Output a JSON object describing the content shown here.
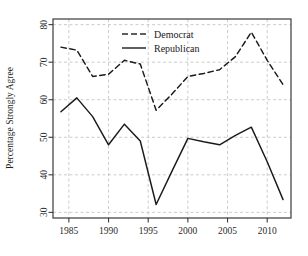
{
  "chart_data": {
    "type": "line",
    "title": "",
    "subtitle": "",
    "xlabel": "",
    "ylabel": "Percentage Strongly Agree",
    "x": [
      1984,
      1986,
      1988,
      1990,
      1992,
      1994,
      1996,
      1998,
      2000,
      2002,
      2004,
      2006,
      2008,
      2010,
      2012
    ],
    "xlim": [
      1983,
      2013
    ],
    "ylim": [
      28.5,
      81.5
    ],
    "xticks": [
      1985,
      1990,
      1995,
      2000,
      2005,
      2010
    ],
    "xtick_labels": [
      "1985",
      "1990",
      "1995",
      "2000",
      "2005",
      "2010"
    ],
    "yticks": [
      30,
      40,
      50,
      60,
      70,
      80
    ],
    "ytick_labels": [
      "30",
      "40",
      "50",
      "60",
      "70",
      "80"
    ],
    "grid": true,
    "grid_style": "dashed",
    "grid_color": "#bfbfbf",
    "frame": true,
    "legend_position": "top-center",
    "series": [
      {
        "name": "Democrat",
        "style": "dashed",
        "color": "#1a1a1a",
        "values": [
          74.0,
          73.2,
          66.2,
          66.8,
          70.5,
          69.5,
          57.2,
          61.5,
          66.2,
          67.0,
          68.0,
          71.5,
          78.0,
          70.5,
          64.0
        ]
      },
      {
        "name": "Republican",
        "style": "solid",
        "color": "#1a1a1a",
        "values": [
          56.8,
          60.5,
          55.5,
          48.0,
          53.5,
          49.0,
          32.1,
          41.0,
          49.7,
          48.8,
          48.0,
          50.5,
          52.7,
          43.5,
          33.4
        ]
      }
    ]
  },
  "legend": {
    "entries": [
      {
        "label": "Democrat",
        "style": "dashed"
      },
      {
        "label": "Republican",
        "style": "solid"
      }
    ]
  },
  "axes": {
    "y_title": "Percentage Strongly Agree"
  }
}
